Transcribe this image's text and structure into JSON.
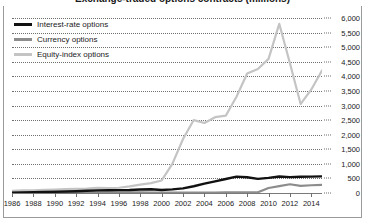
{
  "chart_data": {
    "type": "line",
    "title": "Exchange-traded options contracts (millions)",
    "xlabel": "",
    "ylabel": "",
    "grid": true,
    "grid_style": "dotted-horizontal",
    "legend_position": "top-left",
    "xlim": [
      1986,
      2015
    ],
    "ylim": [
      0,
      6000
    ],
    "ytick_step": 500,
    "x": [
      1986,
      1987,
      1988,
      1989,
      1990,
      1991,
      1992,
      1993,
      1994,
      1995,
      1996,
      1997,
      1998,
      1999,
      2000,
      2001,
      2002,
      2003,
      2004,
      2005,
      2006,
      2007,
      2008,
      2009,
      2010,
      2011,
      2012,
      2013,
      2014,
      2015
    ],
    "xtick_labels": [
      "1986",
      "1988",
      "1990",
      "1992",
      "1994",
      "1996",
      "1998",
      "2000",
      "2002",
      "2004",
      "2006",
      "2008",
      "2010",
      "2012",
      "2014"
    ],
    "ytick_labels": [
      "6,000",
      "5,500",
      "5,000",
      "4,500",
      "4,000",
      "3,500",
      "3,000",
      "2,500",
      "2,000",
      "1,500",
      "1,000",
      "500",
      "0"
    ],
    "ytick_values": [
      6000,
      5500,
      5000,
      4500,
      4000,
      3500,
      3000,
      2500,
      2000,
      1500,
      1000,
      500,
      0
    ],
    "series": [
      {
        "name": "Interest-rate options",
        "color": "#111111",
        "values": [
          10,
          15,
          25,
          35,
          45,
          50,
          60,
          75,
          90,
          95,
          100,
          105,
          120,
          130,
          105,
          125,
          160,
          230,
          320,
          400,
          480,
          560,
          540,
          485,
          520,
          565,
          545,
          555,
          560,
          570
        ]
      },
      {
        "name": "Currency options",
        "color": "#8c8c8c",
        "values": [
          8,
          10,
          14,
          18,
          20,
          20,
          22,
          24,
          26,
          24,
          22,
          20,
          18,
          16,
          14,
          12,
          12,
          12,
          14,
          16,
          18,
          20,
          22,
          24,
          170,
          235,
          300,
          245,
          265,
          280
        ]
      },
      {
        "name": "Equity-index options",
        "color": "#c4c4c4",
        "values": [
          70,
          90,
          95,
          105,
          120,
          130,
          140,
          150,
          175,
          170,
          180,
          230,
          290,
          340,
          430,
          1000,
          1850,
          2500,
          2400,
          2600,
          2650,
          3300,
          4100,
          4250,
          4600,
          5800,
          4450,
          3050,
          3550,
          4200
        ]
      }
    ],
    "annotations": []
  }
}
